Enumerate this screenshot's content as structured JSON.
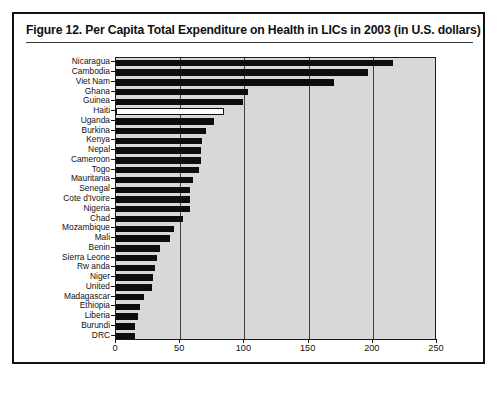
{
  "figure": {
    "title": "Figure 12.  Per Capita Total Expenditure on Health in LICs in 2003 (in U.S. dollars)",
    "frame_color": "#111111",
    "plot_background": "#d8d8d8",
    "bar_color": "#0d0d0d",
    "highlight_bar_color": "#ffffff"
  },
  "chart_data": {
    "type": "bar",
    "orientation": "horizontal",
    "title": "Figure 12.  Per Capita Total Expenditure on Health in LICs in 2003 (in U.S. dollars)",
    "xlabel": "",
    "ylabel": "",
    "xlim": [
      0,
      250
    ],
    "xticks": [
      0,
      50,
      100,
      150,
      200,
      250
    ],
    "xticklabels": [
      "0",
      "50",
      "100",
      "150",
      "200",
      "250"
    ],
    "grid": true,
    "legend": null,
    "highlighted_category": "Haiti",
    "categories": [
      "Nicaragua",
      "Cambodia",
      "Viet Nam",
      "Ghana",
      "Guinea",
      "Haiti",
      "Uganda",
      "Burkina",
      "Kenya",
      "Nepal",
      "Cameroon",
      "Togo",
      "Mauritania",
      "Senegal",
      "Cote d'Ivoire",
      "Nigeria",
      "Chad",
      "Mozambique",
      "Mali",
      "Benin",
      "Sierra Leone",
      "Rw anda",
      "Niger",
      "United",
      "Madagascar",
      "Ethiopia",
      "Liberia",
      "Burundi",
      "DRC"
    ],
    "values": [
      216,
      196,
      170,
      103,
      99,
      84,
      76,
      70,
      67,
      66,
      66,
      65,
      60,
      58,
      58,
      58,
      52,
      45,
      42,
      34,
      32,
      30,
      29,
      28,
      22,
      19,
      17,
      15,
      15
    ]
  }
}
